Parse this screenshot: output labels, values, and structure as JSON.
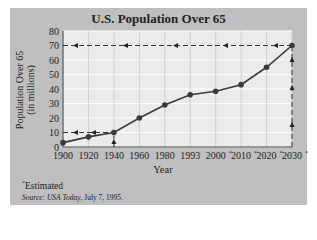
{
  "chart_data": {
    "type": "line",
    "title": "U.S. Population Over 65",
    "xlabel": "Year",
    "ylabel": "Population Over 65 (in millions)",
    "ylabel_line1": "Population Over 65",
    "ylabel_line2": "(in millions)",
    "categories": [
      "1900",
      "1920",
      "1940",
      "1960",
      "1980",
      "1993",
      "2000*",
      "2010*",
      "2020*",
      "2030*"
    ],
    "values": [
      3,
      7,
      10,
      20,
      29,
      36,
      38.5,
      43,
      55,
      70
    ],
    "ylim": [
      0,
      80
    ],
    "yticks": [
      0,
      10,
      20,
      30,
      40,
      50,
      60,
      70,
      80
    ],
    "grid": true,
    "annotations": [
      {
        "type": "dashed-reference",
        "from_year": "1940",
        "value": 10,
        "note": "arrow up from 1940 to point, arrows left to y-axis at 10"
      },
      {
        "type": "dashed-reference",
        "from_year": "2030*",
        "value": 70,
        "note": "arrow up from 2030 to point, arrows left to y-axis at 70"
      }
    ],
    "footnote": "*Estimated",
    "source": "Source: USA Today, July 7, 1995."
  },
  "labels": {
    "title": "U.S. Population Over 65",
    "ylabel_line1": "Population Over 65",
    "ylabel_line2": "(in millions)",
    "xlabel": "Year",
    "footnote_mark": "*",
    "footnote_text": "Estimated",
    "source_prefix": "Source: ",
    "source_pub": "USA Today",
    "source_date": ", July 7, 1995."
  },
  "colors": {
    "panel": "#bfbfbf",
    "plot_bg": "#ebebeb",
    "grid": "#c8c8c8",
    "line": "#3a3a3a"
  }
}
